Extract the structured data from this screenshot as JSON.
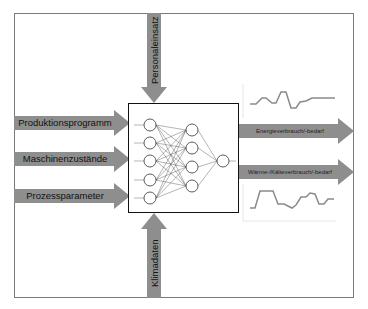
{
  "diagram": {
    "title": "",
    "colors": {
      "arrow": "#8e8e8e",
      "frame": "#7a7a7a",
      "nn_border": "#111111",
      "curve": "#8a8a8a"
    },
    "inputs_left": [
      {
        "label": "Produktionsprogramm"
      },
      {
        "label": "Maschinenzustände"
      },
      {
        "label": "Prozessparameter"
      }
    ],
    "input_top": {
      "label": "Personaleinsatz"
    },
    "input_bottom": {
      "label": "Klimadaten"
    },
    "outputs_right": [
      {
        "label": "Energieverbrauch/-bedarf",
        "curve": "energy-profile"
      },
      {
        "label": "Wärme-/Kälteverbrauch/-bedarf",
        "curve": "heat-cold-profile"
      }
    ],
    "neural_network": {
      "layers": [
        5,
        4,
        1
      ],
      "icon": "neural-network-icon"
    }
  }
}
